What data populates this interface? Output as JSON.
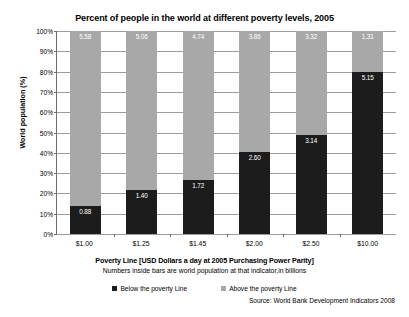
{
  "chart_data": {
    "type": "bar",
    "title": "Percent of people in the world at different poverty levels, 2005",
    "xlabel": "Poverty Line [USD Dollars a day at 2005 Purchasing Power Parity]",
    "xlabel_note": "Numbers inside bars are world population at that indicator,in billions",
    "ylabel": "World population (%)",
    "ylim": [
      0,
      100
    ],
    "ytick_labels": [
      "100%",
      "90%",
      "80%",
      "70%",
      "60%",
      "50%",
      "40%",
      "30%",
      "20%",
      "10%",
      "0%"
    ],
    "ytick_values": [
      100,
      90,
      80,
      70,
      60,
      50,
      40,
      30,
      20,
      10,
      0
    ],
    "grid": true,
    "stacked": true,
    "stack_total_billions": 6.46,
    "categories": [
      "$1.00",
      "$1.25",
      "$1.45",
      "$2.00",
      "$2.50",
      "$10.00"
    ],
    "series": [
      {
        "name": "Below the poverty Line",
        "color": "#1c1c1c",
        "units": "billions of people",
        "values": [
          0.88,
          1.4,
          1.72,
          2.6,
          3.14,
          5.15
        ],
        "percent_values": [
          13.6,
          21.7,
          26.6,
          40.2,
          48.6,
          79.7
        ],
        "labels": [
          "0.88",
          "1.40",
          "1.72",
          "2.60",
          "3.14",
          "5.15"
        ]
      },
      {
        "name": "Above the poverty Line",
        "color": "#a8a8a8",
        "units": "billions of people",
        "values": [
          5.58,
          5.06,
          4.74,
          3.86,
          3.32,
          1.31
        ],
        "percent_values": [
          86.4,
          78.3,
          73.4,
          59.8,
          51.4,
          20.3
        ],
        "labels": [
          "5.58",
          "5.06",
          "4.74",
          "3.86",
          "3.32",
          "1.31"
        ]
      }
    ],
    "legend": {
      "position": "bottom",
      "entries": [
        {
          "label": "Below the poverty Line",
          "color": "#1c1c1c"
        },
        {
          "label": "Above the poverty Line",
          "color": "#a8a8a8"
        }
      ]
    },
    "source": "Source: World Bank Development Indicators 2008"
  }
}
